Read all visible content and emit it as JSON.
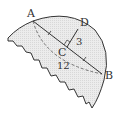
{
  "diagram": {
    "points": {
      "A": "A",
      "B": "B",
      "C": "C",
      "D": "D"
    },
    "measurements": {
      "CD": "3",
      "AB": "12"
    },
    "colors": {
      "fill": "#e6e6e6",
      "stroke": "#333333",
      "dashed": "#555555"
    }
  }
}
